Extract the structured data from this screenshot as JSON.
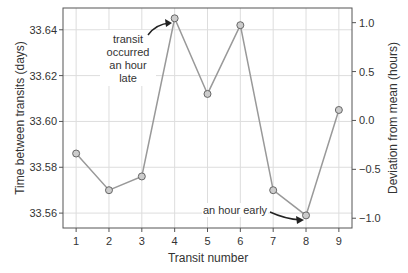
{
  "chart_data": {
    "type": "line",
    "title": "",
    "xlabel": "Transit number",
    "ylabel": "Time between transits (days)",
    "ylabel_right": "Deviation from mean (hours)",
    "x": [
      1,
      2,
      3,
      4,
      5,
      6,
      7,
      8,
      9
    ],
    "categories": [
      "1",
      "2",
      "3",
      "4",
      "5",
      "6",
      "7",
      "8",
      "9"
    ],
    "series": [
      {
        "name": "Time between transits",
        "values": [
          33.586,
          33.57,
          33.576,
          33.645,
          33.612,
          33.642,
          33.57,
          33.559,
          33.605
        ]
      }
    ],
    "ylim": [
      33.5535,
      33.6495
    ],
    "yticks": [
      "33.56",
      "33.58",
      "33.60",
      "33.62",
      "33.64"
    ],
    "ylim_right": [
      -1.1,
      1.15
    ],
    "yticks_right": [
      "−1.0",
      "−0.5",
      "0.0",
      "0.5",
      "1.0"
    ],
    "grid": true,
    "annotations": [
      {
        "text": "transit occurred an hour late",
        "lines": [
          "transit",
          "occurred",
          "an hour",
          "late"
        ],
        "target_x": 4
      },
      {
        "text": "an hour early",
        "target_x": 8
      }
    ]
  }
}
